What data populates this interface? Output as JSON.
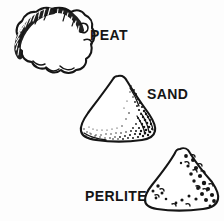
{
  "figure": {
    "background_color": "#fdfdfd",
    "ink_color": "#151515",
    "width": 224,
    "height": 221,
    "specimens": [
      {
        "label": "PEAT",
        "icon": "peat-particle-icon",
        "description": "Irregular lumpy cloud-shaped organic particle with dark hatched fibrous crust along the upper-left edge and scalloped bottom margin",
        "texture": "hatched-fibrous-edge",
        "position": "top-left",
        "label_position": "right-of-shape"
      },
      {
        "label": "SAND",
        "icon": "sand-particle-icon",
        "description": "Rounded triangular mineral grain with dense stippled shading concentrated on the right flank and lower edge",
        "texture": "stipple-gradient",
        "position": "center",
        "label_position": "right-of-shape"
      },
      {
        "label": "PERLITE",
        "icon": "perlite-particle-icon",
        "description": "Rounded triangular lightweight particle with scattered round pores and vesicles clustered toward the right side and corners",
        "texture": "round-pores",
        "position": "bottom-right",
        "label_position": "left-of-shape"
      }
    ]
  }
}
